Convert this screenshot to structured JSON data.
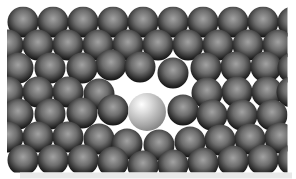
{
  "canvas": {
    "width": 296,
    "height": 179,
    "background": "#ffffff"
  },
  "lattice": {
    "clip": {
      "x": 7,
      "y": 6.5,
      "width": 280.5,
      "height": 166
    },
    "host_atom": {
      "radius": 15.5,
      "gradient": {
        "cx": "50%",
        "cy": "40%",
        "r": "62%",
        "stops": [
          {
            "offset": "0%",
            "color": "#a2a2a2"
          },
          {
            "offset": "45%",
            "color": "#6e6e6e"
          },
          {
            "offset": "80%",
            "color": "#2e2e2e"
          },
          {
            "offset": "100%",
            "color": "#0c0c0c"
          }
        ]
      }
    },
    "impurity_atom": {
      "x": 147,
      "y": 112,
      "radius": 19,
      "gradient": {
        "cx": "36%",
        "cy": "30%",
        "r": "78%",
        "stops": [
          {
            "offset": "0%",
            "color": "#ffffff"
          },
          {
            "offset": "30%",
            "color": "#dcdcdc"
          },
          {
            "offset": "70%",
            "color": "#a8a8a8"
          },
          {
            "offset": "100%",
            "color": "#7c7c7c"
          }
        ]
      }
    },
    "host_positions": [
      [
        23,
        22
      ],
      [
        53,
        22
      ],
      [
        83,
        22
      ],
      [
        113,
        22
      ],
      [
        143,
        22
      ],
      [
        173,
        22
      ],
      [
        203,
        22
      ],
      [
        233,
        22
      ],
      [
        263,
        22
      ],
      [
        293,
        22
      ],
      [
        8,
        45
      ],
      [
        38,
        45
      ],
      [
        68,
        45
      ],
      [
        98,
        45
      ],
      [
        128,
        45
      ],
      [
        158,
        45
      ],
      [
        188,
        45
      ],
      [
        218,
        45
      ],
      [
        248,
        45
      ],
      [
        278,
        45
      ],
      [
        18,
        68
      ],
      [
        50,
        68
      ],
      [
        82,
        68
      ],
      [
        111,
        65
      ],
      [
        140,
        67
      ],
      [
        173,
        73
      ],
      [
        206,
        68
      ],
      [
        236,
        67
      ],
      [
        266,
        67
      ],
      [
        293,
        68
      ],
      [
        8,
        92
      ],
      [
        38,
        92
      ],
      [
        68,
        92
      ],
      [
        99,
        94
      ],
      [
        207,
        93
      ],
      [
        237,
        92
      ],
      [
        267,
        92
      ],
      [
        292,
        92
      ],
      [
        18,
        114
      ],
      [
        50,
        114
      ],
      [
        82,
        113
      ],
      [
        113,
        110
      ],
      [
        183,
        110
      ],
      [
        212,
        115
      ],
      [
        242,
        115
      ],
      [
        272,
        115
      ],
      [
        8,
        137
      ],
      [
        38,
        137
      ],
      [
        68,
        137
      ],
      [
        99,
        139
      ],
      [
        127,
        144
      ],
      [
        159,
        145
      ],
      [
        190,
        142
      ],
      [
        220,
        140
      ],
      [
        250,
        139
      ],
      [
        280,
        138
      ],
      [
        23,
        160
      ],
      [
        53,
        160
      ],
      [
        83,
        160
      ],
      [
        113,
        162
      ],
      [
        143,
        166
      ],
      [
        173,
        165
      ],
      [
        203,
        163
      ],
      [
        233,
        161
      ],
      [
        263,
        160
      ],
      [
        293,
        160
      ]
    ]
  },
  "bottom_shadow": {
    "x": 20,
    "y": 172.5,
    "width": 272,
    "height": 6,
    "color": "#e8e8e8"
  }
}
